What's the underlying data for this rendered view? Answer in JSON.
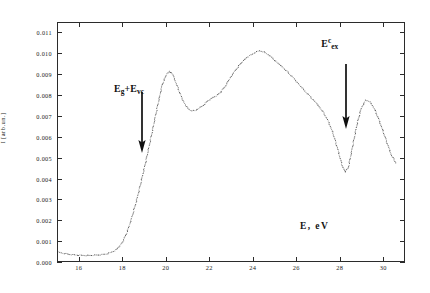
{
  "figure": {
    "background": "#ffffff",
    "axis_color": "#2b2b2b",
    "data_color": "#3a3a3a"
  },
  "axes": {
    "x_title": "E, eV",
    "y_title": "I [arb.un.]",
    "x_ticks": [
      "16",
      "18",
      "20",
      "22",
      "24",
      "26",
      "28",
      "30"
    ],
    "y_ticks": [
      "0.000",
      "0.001",
      "0.002",
      "0.003",
      "0.004",
      "0.005",
      "0.006",
      "0.007",
      "0.008",
      "0.009",
      "0.010",
      "0.011"
    ]
  },
  "annotations": [
    {
      "id": "eg-evc",
      "base1": "E",
      "sub1": "g",
      "plus": "+",
      "base2": "E",
      "sub2": "vc",
      "text": "Eg+Evc",
      "arrow": "down-arrow",
      "x_value": 19.0
    },
    {
      "id": "e-ex-c",
      "base": "E",
      "sup": "c",
      "sub": "ex",
      "text": "Eex",
      "arrow": "down-arrow",
      "x_value": 28.25
    }
  ],
  "chart_data": {
    "type": "scatter",
    "title": "",
    "xlabel": "E, eV",
    "ylabel": "I [arb.un.]",
    "xlim": [
      15.0,
      31.0
    ],
    "ylim": [
      0.0,
      0.0115
    ],
    "grid": false,
    "legend": null,
    "marker": "dot",
    "series": [
      {
        "name": "luminescence excitation spectrum",
        "x": [
          15.0,
          15.2,
          15.4,
          15.6,
          15.8,
          16.0,
          16.2,
          16.4,
          16.6,
          16.8,
          17.0,
          17.2,
          17.4,
          17.6,
          17.8,
          18.0,
          18.2,
          18.4,
          18.6,
          18.8,
          19.0,
          19.2,
          19.4,
          19.6,
          19.8,
          20.0,
          20.15,
          20.3,
          20.5,
          20.7,
          20.9,
          21.1,
          21.3,
          21.5,
          21.7,
          21.9,
          22.1,
          22.3,
          22.5,
          22.7,
          22.9,
          23.1,
          23.3,
          23.5,
          23.7,
          23.9,
          24.1,
          24.3,
          24.5,
          24.7,
          24.9,
          25.1,
          25.3,
          25.5,
          25.7,
          25.9,
          26.1,
          26.3,
          26.5,
          26.7,
          26.9,
          27.1,
          27.3,
          27.5,
          27.7,
          27.9,
          28.1,
          28.25,
          28.4,
          28.6,
          28.8,
          29.0,
          29.2,
          29.4,
          29.6,
          29.8,
          30.0,
          30.2,
          30.4,
          30.6
        ],
        "y": [
          0.00045,
          0.0004,
          0.00036,
          0.00033,
          0.00031,
          0.0003,
          0.00029,
          0.00029,
          0.0003,
          0.00031,
          0.00033,
          0.00036,
          0.00042,
          0.00052,
          0.0007,
          0.001,
          0.0015,
          0.00215,
          0.0029,
          0.00375,
          0.00465,
          0.0056,
          0.0066,
          0.0076,
          0.00855,
          0.00905,
          0.0092,
          0.009,
          0.00845,
          0.0079,
          0.0075,
          0.0073,
          0.00728,
          0.0074,
          0.00755,
          0.00775,
          0.0079,
          0.008,
          0.00818,
          0.00845,
          0.0088,
          0.00912,
          0.0094,
          0.00965,
          0.00985,
          0.00998,
          0.0101,
          0.01018,
          0.01012,
          0.01,
          0.00982,
          0.00962,
          0.00945,
          0.00925,
          0.00905,
          0.00882,
          0.00858,
          0.00835,
          0.00812,
          0.0079,
          0.00768,
          0.00742,
          0.00712,
          0.00672,
          0.00618,
          0.00548,
          0.0047,
          0.00432,
          0.00452,
          0.00555,
          0.0066,
          0.0074,
          0.00778,
          0.00772,
          0.0074,
          0.0069,
          0.00632,
          0.00572,
          0.00512,
          0.00478
        ]
      }
    ]
  }
}
